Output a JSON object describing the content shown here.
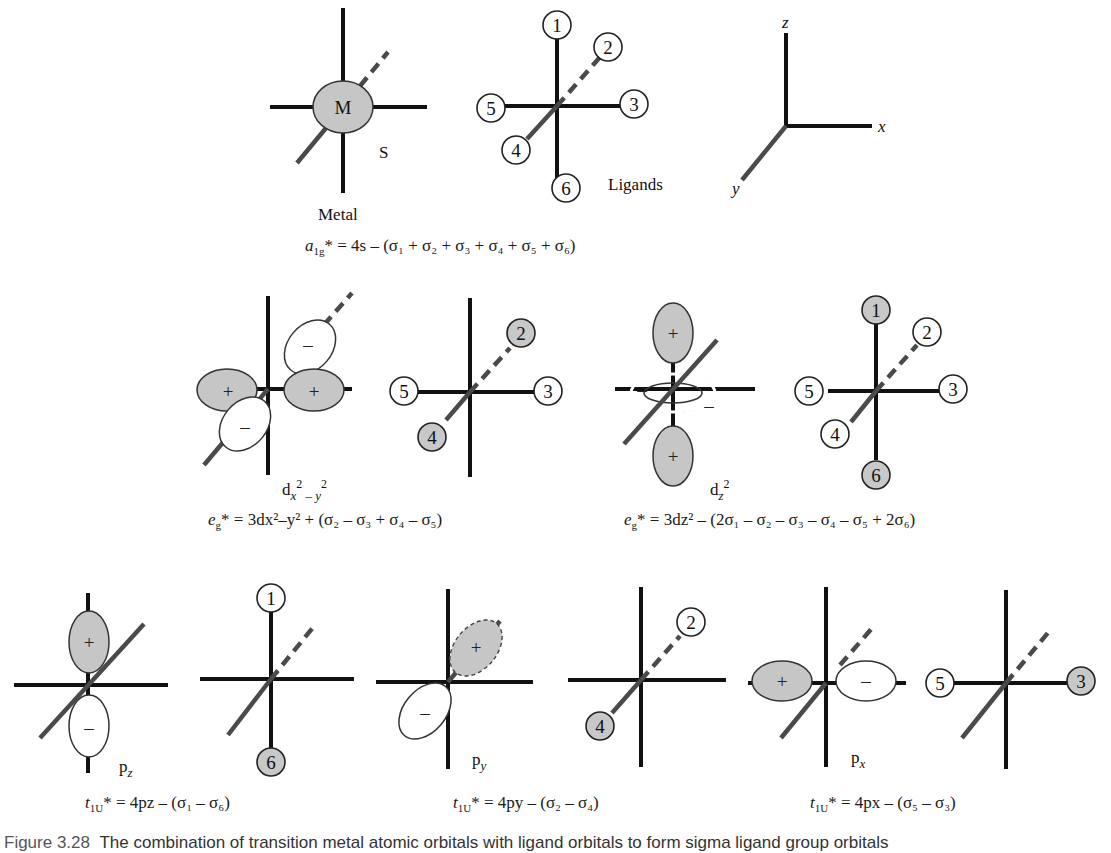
{
  "figure": {
    "caption_label": "Figure 3.28",
    "caption_text": "The combination of transition metal atomic orbitals with ligand orbitals to form sigma ligand group orbitals",
    "colors": {
      "shaded": "#c6c6c6",
      "unshaded": "#ffffff",
      "line": "#111111",
      "diagonal_axis": "#4a4a4a"
    }
  },
  "row1": {
    "metal": {
      "center_label": "M",
      "orbital_label": "S",
      "caption": "Metal"
    },
    "ligands": {
      "caption": "Ligands",
      "positions": [
        {
          "n": "1",
          "shaded": false
        },
        {
          "n": "2",
          "shaded": false
        },
        {
          "n": "3",
          "shaded": false
        },
        {
          "n": "4",
          "shaded": false
        },
        {
          "n": "5",
          "shaded": false
        },
        {
          "n": "6",
          "shaded": false
        }
      ]
    },
    "axes": {
      "x": "x",
      "y": "y",
      "z": "z"
    },
    "equation": {
      "symbol": "a",
      "symbol_sub": "1g",
      "rhs": "* = 4s – (σ₁ + σ₂ + σ₃ + σ₄ + σ₅ + σ₆)"
    }
  },
  "row2": {
    "dx2y2": {
      "orbital_label": "dx²–y²",
      "lobe_signs": {
        "left": "+",
        "right": "+",
        "back": "–",
        "front": "–"
      },
      "ligands_shown": [
        {
          "n": "2",
          "shaded": true
        },
        {
          "n": "3",
          "shaded": false
        },
        {
          "n": "4",
          "shaded": true
        },
        {
          "n": "5",
          "shaded": false
        }
      ],
      "equation": {
        "symbol": "e",
        "symbol_sub": "g",
        "rhs": "* = 3dx²–y² + (σ₂ – σ₃ + σ₄ – σ₅)"
      }
    },
    "dz2": {
      "orbital_label": "dz²",
      "lobe_signs": {
        "top": "+",
        "bottom": "+",
        "ring_left": "–",
        "ring_right": "–"
      },
      "ligands_shown": [
        {
          "n": "1",
          "shaded": true
        },
        {
          "n": "2",
          "shaded": false
        },
        {
          "n": "3",
          "shaded": false
        },
        {
          "n": "4",
          "shaded": false
        },
        {
          "n": "5",
          "shaded": false
        },
        {
          "n": "6",
          "shaded": true
        }
      ],
      "equation": {
        "symbol": "e",
        "symbol_sub": "g",
        "rhs": "* = 3dz² – (2σ₁ – σ₂ – σ₃ – σ₄ – σ₅ + 2σ₆)"
      }
    }
  },
  "row3": {
    "pz": {
      "orbital_label": "pz",
      "lobe_signs": {
        "top": "+",
        "bottom": "–"
      },
      "ligands_shown": [
        {
          "n": "1",
          "shaded": false
        },
        {
          "n": "6",
          "shaded": true
        }
      ],
      "equation": {
        "symbol": "t",
        "symbol_sub": "1U",
        "rhs": "* = 4pz – (σ₁ –  σ₆)"
      }
    },
    "py": {
      "orbital_label": "py",
      "lobe_signs": {
        "back": "+",
        "front": "–"
      },
      "ligands_shown": [
        {
          "n": "2",
          "shaded": false
        },
        {
          "n": "4",
          "shaded": true
        }
      ],
      "equation": {
        "symbol": "t",
        "symbol_sub": "1U",
        "rhs": "* = 4py – (σ₂ –  σ₄)"
      }
    },
    "px": {
      "orbital_label": "px",
      "lobe_signs": {
        "left": "+",
        "right": "–"
      },
      "ligands_shown": [
        {
          "n": "5",
          "shaded": false
        },
        {
          "n": "3",
          "shaded": true
        }
      ],
      "equation": {
        "symbol": "t",
        "symbol_sub": "1U",
        "rhs": "* = 4px – (σ₅ –  σ₃)"
      }
    }
  }
}
